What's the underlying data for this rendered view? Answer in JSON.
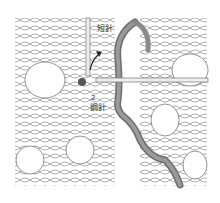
{
  "diagram": {
    "type": "crochet-illustration",
    "labels": {
      "top_needle": "短針",
      "step_number": "2",
      "middle_needle": "鋼針"
    },
    "colors": {
      "background": "#ffffff",
      "outline": "#555555",
      "yarn_fill": "#ffffff",
      "highlight_yarn": "#8a8a8a",
      "highlight_yarn_dark": "#6e6e6e",
      "needle": "#e8e8e8",
      "arrow": "#222222"
    }
  }
}
